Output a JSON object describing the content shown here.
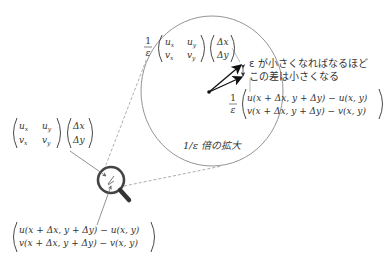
{
  "diagram": {
    "magnified_view": {
      "scale_label": "1/ε 倍の拡大",
      "linear_term": {
        "prefix_num": "1",
        "prefix_den": "ε",
        "matrix": [
          [
            "u",
            "x",
            "u",
            "y"
          ],
          [
            "v",
            "x",
            "v",
            "y"
          ]
        ],
        "vector": [
          "Δx",
          "Δy"
        ]
      },
      "difference_term": {
        "prefix_num": "1",
        "prefix_den": "ε",
        "rows": [
          "u(x + Δx, y + Δy) − u(x, y)",
          "v(x + Δx, y + Δy) − v(x, y)"
        ]
      },
      "annotation": [
        "ε が小さくなればなるほど",
        "この差は小さくなる"
      ]
    },
    "original_view": {
      "linear_term": {
        "matrix": [
          [
            "u",
            "x",
            "u",
            "y"
          ],
          [
            "v",
            "x",
            "v",
            "y"
          ]
        ],
        "vector": [
          "Δx",
          "Δy"
        ]
      },
      "difference_term": {
        "rows": [
          "u(x + Δx, y + Δy) − u(x, y)",
          "v(x + Δx, y + Δy) − v(x, y)"
        ]
      }
    },
    "colors": {
      "stroke": "#555555",
      "arrow": "#111111",
      "magnifier": "#444444",
      "text": "#333333"
    }
  }
}
